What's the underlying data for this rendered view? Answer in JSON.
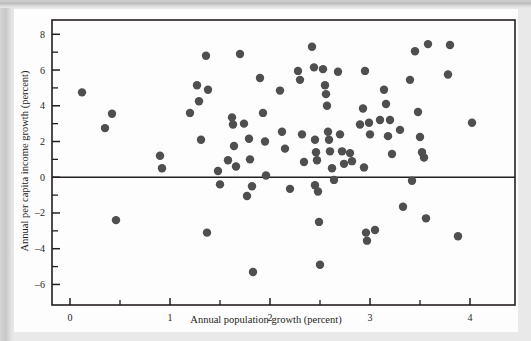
{
  "figure": {
    "background_color": "#fdfdfd",
    "page_background_color": "#e9e9e9",
    "frame_color": "#231f20",
    "marker_color": "#4f4f4f"
  },
  "chart_data": {
    "type": "scatter",
    "title": "",
    "xlabel": "Annual population growth (percent)",
    "ylabel": "Annual per capita income growth (percent)",
    "xlim": [
      -0.18,
      4.45
    ],
    "ylim": [
      -7.15,
      8.8
    ],
    "xticks": [
      0,
      1,
      2,
      3,
      4
    ],
    "xtick_labels": [
      "0",
      "1",
      "2",
      "3",
      "4"
    ],
    "x_minor_ticks": [
      0.5,
      1.5,
      2.5,
      3.5
    ],
    "yticks": [
      8,
      6,
      4,
      2,
      0,
      -2,
      -4,
      -6
    ],
    "ytick_labels": [
      "8",
      "6",
      "4",
      "2",
      "0",
      "–2",
      "–4",
      "–6"
    ],
    "y_minor_ticks": [
      7,
      5,
      3,
      1,
      -1,
      -3,
      -5
    ],
    "grid": false,
    "legend": null,
    "reference_lines": [
      {
        "axis": "y",
        "value": 0
      }
    ],
    "marker_size": 4.2,
    "points": [
      [
        0.12,
        4.75
      ],
      [
        0.35,
        2.75
      ],
      [
        0.42,
        3.55
      ],
      [
        0.46,
        -2.4
      ],
      [
        0.9,
        1.2
      ],
      [
        0.92,
        0.5
      ],
      [
        1.2,
        3.6
      ],
      [
        1.27,
        5.15
      ],
      [
        1.29,
        4.25
      ],
      [
        1.31,
        2.1
      ],
      [
        1.36,
        6.8
      ],
      [
        1.38,
        4.9
      ],
      [
        1.37,
        -3.1
      ],
      [
        1.48,
        0.35
      ],
      [
        1.5,
        -0.4
      ],
      [
        1.58,
        0.95
      ],
      [
        1.62,
        3.35
      ],
      [
        1.63,
        2.95
      ],
      [
        1.64,
        1.75
      ],
      [
        1.66,
        0.6
      ],
      [
        1.7,
        6.9
      ],
      [
        1.74,
        3.0
      ],
      [
        1.77,
        -1.05
      ],
      [
        1.79,
        2.15
      ],
      [
        1.8,
        1.0
      ],
      [
        1.82,
        -0.5
      ],
      [
        1.83,
        -5.3
      ],
      [
        1.9,
        5.55
      ],
      [
        1.93,
        3.6
      ],
      [
        1.95,
        2.0
      ],
      [
        1.96,
        0.1
      ],
      [
        2.1,
        4.85
      ],
      [
        2.12,
        2.55
      ],
      [
        2.15,
        1.6
      ],
      [
        2.2,
        -0.65
      ],
      [
        2.28,
        5.95
      ],
      [
        2.3,
        5.45
      ],
      [
        2.32,
        2.4
      ],
      [
        2.34,
        0.85
      ],
      [
        2.42,
        7.3
      ],
      [
        2.44,
        6.15
      ],
      [
        2.45,
        2.1
      ],
      [
        2.46,
        1.4
      ],
      [
        2.47,
        0.95
      ],
      [
        2.45,
        -0.45
      ],
      [
        2.48,
        -0.8
      ],
      [
        2.49,
        -2.5
      ],
      [
        2.5,
        -4.9
      ],
      [
        2.53,
        6.05
      ],
      [
        2.55,
        5.15
      ],
      [
        2.56,
        4.65
      ],
      [
        2.57,
        4.0
      ],
      [
        2.58,
        2.55
      ],
      [
        2.59,
        2.1
      ],
      [
        2.6,
        1.45
      ],
      [
        2.62,
        0.5
      ],
      [
        2.64,
        -0.15
      ],
      [
        2.68,
        5.9
      ],
      [
        2.7,
        2.4
      ],
      [
        2.72,
        1.45
      ],
      [
        2.74,
        0.75
      ],
      [
        2.8,
        1.35
      ],
      [
        2.82,
        0.9
      ],
      [
        2.9,
        2.95
      ],
      [
        2.93,
        3.85
      ],
      [
        2.94,
        0.55
      ],
      [
        2.95,
        5.95
      ],
      [
        2.96,
        -3.1
      ],
      [
        2.97,
        -3.55
      ],
      [
        2.99,
        3.05
      ],
      [
        3.0,
        2.4
      ],
      [
        3.05,
        -2.95
      ],
      [
        3.1,
        3.2
      ],
      [
        3.14,
        4.9
      ],
      [
        3.16,
        4.1
      ],
      [
        3.18,
        2.3
      ],
      [
        3.2,
        3.2
      ],
      [
        3.22,
        1.3
      ],
      [
        3.3,
        2.65
      ],
      [
        3.33,
        -1.65
      ],
      [
        3.4,
        5.45
      ],
      [
        3.42,
        -0.2
      ],
      [
        3.45,
        7.05
      ],
      [
        3.48,
        3.65
      ],
      [
        3.5,
        2.25
      ],
      [
        3.52,
        1.4
      ],
      [
        3.54,
        1.1
      ],
      [
        3.56,
        -2.3
      ],
      [
        3.58,
        7.45
      ],
      [
        3.78,
        5.75
      ],
      [
        3.8,
        7.4
      ],
      [
        3.88,
        -3.3
      ],
      [
        4.02,
        3.05
      ]
    ]
  }
}
